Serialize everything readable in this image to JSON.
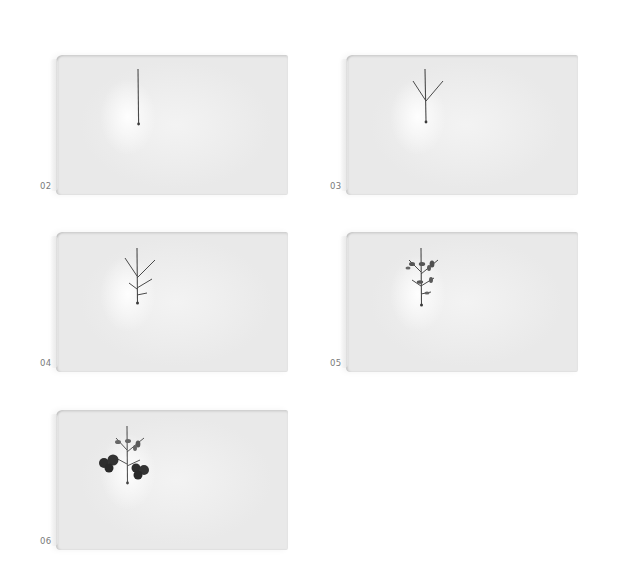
{
  "panels": [
    {
      "label": "02",
      "stage": "single-stem",
      "x": 40,
      "y": 55
    },
    {
      "label": "03",
      "stage": "stem-with-two-branches",
      "x": 330,
      "y": 55
    },
    {
      "label": "04",
      "stage": "stem-with-four-branches",
      "x": 40,
      "y": 232
    },
    {
      "label": "05",
      "stage": "branches-with-small-leaves",
      "x": 330,
      "y": 232
    },
    {
      "label": "06",
      "stage": "branches-with-dark-leaf-clusters",
      "x": 40,
      "y": 410
    }
  ],
  "colors": {
    "ink": "#4a4a4a",
    "dark_ink": "#2e2e2e",
    "paper": "#ededed",
    "label": "#7a7a7a"
  }
}
